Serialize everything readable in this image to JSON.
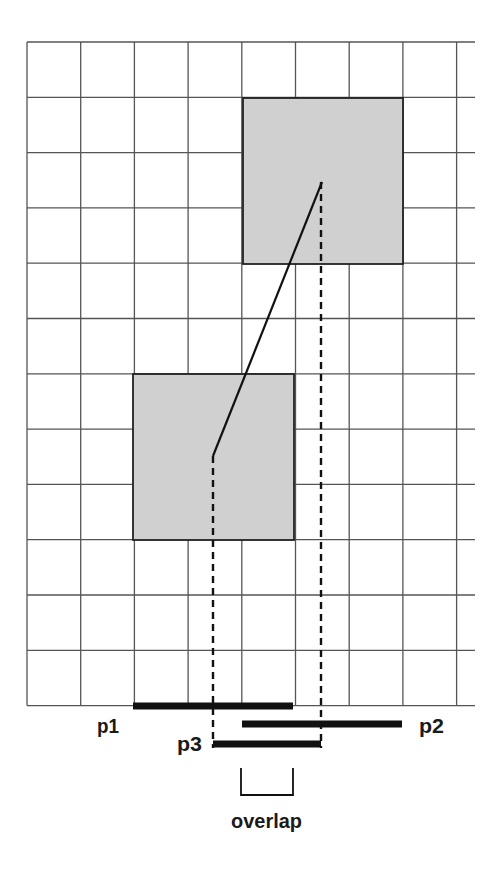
{
  "diagram": {
    "type": "collision-overlap-projection",
    "grid": {
      "columns": 8,
      "rows": 12,
      "origin": [
        27,
        42
      ],
      "cell_width": 53.7,
      "cell_height": 55.3,
      "extend_right_to": 475,
      "line_color": "#555555"
    },
    "boxes": [
      {
        "name": "upper-box",
        "x": 243,
        "y": 98,
        "w": 160,
        "h": 166,
        "fill": "#d0d0d0",
        "stroke": "#222222"
      },
      {
        "name": "lower-box",
        "x": 133,
        "y": 374,
        "w": 161,
        "h": 166,
        "fill": "#d0d0d0",
        "stroke": "#222222"
      }
    ],
    "center_line": {
      "from": [
        213,
        456
      ],
      "to": [
        322,
        182
      ]
    },
    "dashed_projections": [
      {
        "x": 213,
        "y1": 456,
        "y2": 748
      },
      {
        "x": 321,
        "y1": 182,
        "y2": 748
      }
    ],
    "projection_bars": [
      {
        "id": "p1",
        "x1": 133,
        "x2": 293,
        "y": 706
      },
      {
        "id": "p2",
        "x1": 242,
        "x2": 402,
        "y": 724
      },
      {
        "id": "p3",
        "x1": 213,
        "x2": 321,
        "y": 744
      }
    ],
    "overlap_bracket": {
      "x1": 241,
      "x2": 293,
      "y_top": 768,
      "y_bottom": 795
    }
  },
  "labels": {
    "p1": "p1",
    "p2": "p2",
    "p3": "p3",
    "overlap": "overlap"
  },
  "colors": {
    "grid": "#555555",
    "box_fill": "#d0d0d0",
    "ink": "#111111"
  }
}
